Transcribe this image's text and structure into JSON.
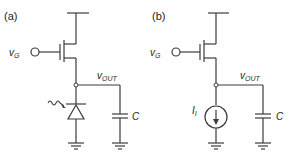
{
  "panels": [
    {
      "id": "a",
      "label": "(a)",
      "gate_label_main": "v",
      "gate_label_sub": "G",
      "output_label_main": "v",
      "output_label_sub": "OUT",
      "capacitor_label": "C",
      "load_element": "photodiode"
    },
    {
      "id": "b",
      "label": "(b)",
      "gate_label_main": "v",
      "gate_label_sub": "G",
      "output_label_main": "v",
      "output_label_sub": "OUT",
      "capacitor_label": "C",
      "current_source_main": "I",
      "current_source_sub": "I",
      "load_element": "current-source"
    }
  ],
  "colors": {
    "wire": "#3c3c3c",
    "text": "#231f20",
    "background": "#ffffff"
  }
}
